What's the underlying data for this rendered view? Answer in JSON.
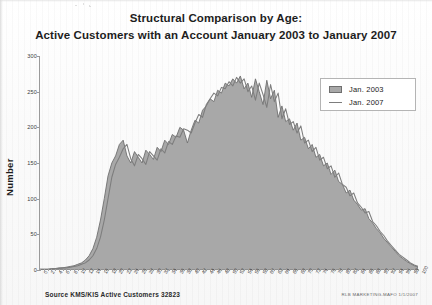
{
  "document": {
    "title_line_1": "Structural Comparison by Age:",
    "title_line_2": "Active Customers with an Account January 2003 to January 2007"
  },
  "footer": {
    "source": "Source KMS/KIS Active Customers 32823",
    "stamp": "RLB MARKETING-MAFO 1/1/2007"
  },
  "legend": {
    "items": [
      {
        "label": "Jan. 2003",
        "swatch": "area"
      },
      {
        "label": "Jan. 2007",
        "swatch": "line"
      }
    ]
  },
  "colors": {
    "area_fill": "#a8a8a8",
    "area_stroke": "#6f6f6f",
    "line_2007": "#7d7d7d",
    "axis": "#9a9a9a",
    "text": "#1d1d1d",
    "background": "#fdfdfd"
  },
  "chart_data": {
    "type": "area",
    "title": "Structural Comparison by Age: Active Customers with an Account January 2003 to January 2007",
    "xlabel": "Age in years",
    "ylabel": "Number",
    "xlim": [
      0,
      100
    ],
    "ylim": [
      0,
      300
    ],
    "yticks": [
      0,
      50,
      100,
      150,
      200,
      250,
      300
    ],
    "ytick_labels": [
      "0",
      "50",
      "100",
      "150",
      "200",
      "250",
      "300"
    ],
    "grid": false,
    "legend_position": "upper right",
    "x": [
      0,
      1,
      2,
      3,
      4,
      5,
      6,
      7,
      8,
      9,
      10,
      11,
      12,
      13,
      14,
      15,
      16,
      17,
      18,
      19,
      20,
      21,
      22,
      23,
      24,
      25,
      26,
      27,
      28,
      29,
      30,
      31,
      32,
      33,
      34,
      35,
      36,
      37,
      38,
      39,
      40,
      41,
      42,
      43,
      44,
      45,
      46,
      47,
      48,
      49,
      50,
      51,
      52,
      53,
      54,
      55,
      56,
      57,
      58,
      59,
      60,
      61,
      62,
      63,
      64,
      65,
      66,
      67,
      68,
      69,
      70,
      71,
      72,
      73,
      74,
      75,
      76,
      77,
      78,
      79,
      80,
      81,
      82,
      83,
      84,
      85,
      86,
      87,
      88,
      89,
      90,
      91,
      92,
      93,
      94,
      95,
      96,
      97,
      98,
      99,
      100
    ],
    "xtick_labels": [
      "0",
      "1",
      "2",
      "3",
      "4",
      "5",
      "6",
      "7",
      "8",
      "9",
      "10",
      "11",
      "12",
      "13",
      "14",
      "15",
      "16",
      "17",
      "18",
      "19",
      "20",
      "21",
      "22",
      "23",
      "24",
      "25",
      "26",
      "27",
      "28",
      "29",
      "30",
      "31",
      "32",
      "33",
      "34",
      "35",
      "36",
      "37",
      "38",
      "39",
      "40",
      "41",
      "42",
      "43",
      "44",
      "45",
      "46",
      "47",
      "48",
      "49",
      "50",
      "51",
      "52",
      "53",
      "54",
      "55",
      "56",
      "57",
      "58",
      "59",
      "60",
      "61",
      "62",
      "63",
      "64",
      "65",
      "66",
      "67",
      "68",
      "69",
      "70",
      "71",
      "72",
      "73",
      "74",
      "75",
      "76",
      "77",
      "78",
      "79",
      "80",
      "81",
      "82",
      "83",
      "84",
      "85",
      "86",
      "87",
      "88",
      "89",
      "90",
      "91",
      "92",
      "93",
      "94",
      "95",
      "96",
      "97",
      "98",
      "99",
      "100"
    ],
    "series": [
      {
        "name": "Jan. 2003",
        "style": "filled-area",
        "values": [
          1,
          1,
          1,
          2,
          2,
          3,
          3,
          4,
          5,
          6,
          8,
          10,
          14,
          20,
          30,
          46,
          70,
          100,
          132,
          150,
          160,
          176,
          182,
          160,
          150,
          166,
          158,
          150,
          168,
          162,
          155,
          172,
          166,
          182,
          176,
          190,
          186,
          200,
          196,
          178,
          196,
          210,
          206,
          224,
          230,
          240,
          236,
          252,
          248,
          262,
          258,
          268,
          262,
          272,
          254,
          262,
          242,
          268,
          250,
          232,
          266,
          240,
          252,
          214,
          230,
          208,
          212,
          196,
          206,
          182,
          186,
          170,
          176,
          158,
          162,
          146,
          150,
          134,
          140,
          124,
          120,
          108,
          112,
          98,
          92,
          84,
          86,
          72,
          66,
          58,
          52,
          44,
          38,
          32,
          26,
          20,
          16,
          12,
          9,
          6,
          4
        ]
      },
      {
        "name": "Jan. 2007",
        "style": "line",
        "values": [
          1,
          1,
          1,
          1,
          2,
          2,
          3,
          3,
          4,
          5,
          6,
          8,
          10,
          14,
          20,
          30,
          46,
          70,
          100,
          130,
          148,
          158,
          170,
          176,
          156,
          146,
          162,
          156,
          148,
          166,
          160,
          154,
          170,
          164,
          180,
          176,
          188,
          186,
          198,
          196,
          192,
          206,
          218,
          214,
          232,
          240,
          248,
          244,
          256,
          254,
          264,
          258,
          270,
          262,
          268,
          250,
          258,
          238,
          262,
          246,
          228,
          260,
          236,
          248,
          212,
          226,
          204,
          208,
          192,
          202,
          178,
          182,
          166,
          172,
          154,
          158,
          142,
          146,
          130,
          136,
          120,
          116,
          104,
          108,
          94,
          88,
          80,
          82,
          68,
          62,
          54,
          48,
          40,
          34,
          28,
          22,
          18,
          14,
          10,
          7,
          5
        ]
      }
    ]
  }
}
